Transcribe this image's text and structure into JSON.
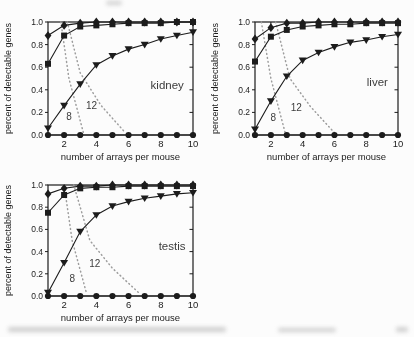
{
  "figure": {
    "background": "#fcfcfc",
    "ink": "#1c1c1c",
    "dotted_color": "#9d9d9d",
    "annotation_color": "#3c3c3c"
  },
  "chart_data": [
    {
      "type": "line",
      "tissue_label": "kidney",
      "tissue_label_pos": [
        8.4,
        0.41
      ],
      "xlabel": "number of arrays per mouse",
      "ylabel": "percent of detectable genes",
      "xlim": [
        1,
        10
      ],
      "ylim": [
        0,
        1
      ],
      "xticks": [
        2,
        4,
        6,
        8,
        10
      ],
      "yticks": [
        0.0,
        0.2,
        0.4,
        0.6,
        0.8,
        1.0
      ],
      "ytick_labels": [
        "0.0",
        "0.2",
        "0.4",
        "0.6",
        "0.8",
        "1.0"
      ],
      "grid": false,
      "legend": "none",
      "x": [
        1,
        2,
        3,
        4,
        5,
        6,
        7,
        8,
        9,
        10
      ],
      "series": [
        {
          "name": "high-start-curve",
          "marker": "diamond",
          "values": [
            0.88,
            0.97,
            0.99,
            1.0,
            1.0,
            1.0,
            1.0,
            1.0,
            1.0,
            1.0
          ]
        },
        {
          "name": "mid-start-curve",
          "marker": "square",
          "values": [
            0.63,
            0.88,
            0.96,
            0.97,
            0.98,
            0.99,
            0.99,
            0.99,
            1.0,
            1.0
          ]
        },
        {
          "name": "low-start-curve",
          "marker": "triangle-down",
          "values": [
            0.06,
            0.26,
            0.45,
            0.62,
            0.7,
            0.76,
            0.8,
            0.85,
            0.88,
            0.91
          ]
        },
        {
          "name": "zero-line",
          "marker": "circle",
          "values": [
            0,
            0,
            0,
            0,
            0,
            0,
            0,
            0,
            0,
            0
          ]
        }
      ],
      "dotted_lines": [
        {
          "label": "8",
          "points": [
            [
              1.8,
              1.0
            ],
            [
              2.3,
              0.5
            ],
            [
              3.2,
              0.02
            ]
          ],
          "label_pos": [
            2.3,
            0.13
          ]
        },
        {
          "label": "12",
          "points": [
            [
              2.2,
              1.0
            ],
            [
              3.0,
              0.55
            ],
            [
              4.3,
              0.26
            ],
            [
              5.8,
              0.02
            ]
          ],
          "label_pos": [
            3.7,
            0.23
          ]
        }
      ]
    },
    {
      "type": "line",
      "tissue_label": "liver",
      "tissue_label_pos": [
        8.7,
        0.43
      ],
      "xlabel": "number of arrays per mouse",
      "ylabel": "percent of detectable genes",
      "xlim": [
        1,
        10
      ],
      "ylim": [
        0,
        1
      ],
      "xticks": [
        2,
        4,
        6,
        8,
        10
      ],
      "yticks": [
        0.0,
        0.2,
        0.4,
        0.6,
        0.8,
        1.0
      ],
      "ytick_labels": [
        "0.0",
        "0.2",
        "0.4",
        "0.6",
        "0.8",
        "1.0"
      ],
      "grid": false,
      "legend": "none",
      "x": [
        1,
        2,
        3,
        4,
        5,
        6,
        7,
        8,
        9,
        10
      ],
      "series": [
        {
          "name": "high-start-curve",
          "marker": "diamond",
          "values": [
            0.85,
            0.95,
            0.99,
            0.99,
            1.0,
            1.0,
            1.0,
            1.0,
            1.0,
            1.0
          ]
        },
        {
          "name": "mid-start-curve",
          "marker": "square",
          "values": [
            0.65,
            0.87,
            0.93,
            0.96,
            0.97,
            0.98,
            0.98,
            0.99,
            0.99,
            0.99
          ]
        },
        {
          "name": "low-start-curve",
          "marker": "triangle-down",
          "values": [
            0.05,
            0.3,
            0.52,
            0.66,
            0.73,
            0.78,
            0.82,
            0.84,
            0.87,
            0.89
          ]
        },
        {
          "name": "zero-line",
          "marker": "circle",
          "values": [
            0,
            0,
            0,
            0,
            0,
            0,
            0,
            0,
            0,
            0
          ]
        }
      ],
      "dotted_lines": [
        {
          "label": "8",
          "points": [
            [
              1.4,
              1.0
            ],
            [
              2.0,
              0.5
            ],
            [
              2.9,
              0.02
            ]
          ],
          "label_pos": [
            2.15,
            0.12
          ]
        },
        {
          "label": "12",
          "points": [
            [
              2.3,
              1.0
            ],
            [
              3.2,
              0.5
            ],
            [
              4.5,
              0.25
            ],
            [
              6.0,
              0.02
            ]
          ],
          "label_pos": [
            3.6,
            0.21
          ]
        }
      ]
    },
    {
      "type": "line",
      "tissue_label": "testis",
      "tissue_label_pos": [
        8.7,
        0.41
      ],
      "xlabel": "number of arrays per mouse",
      "ylabel": "percent of detectable genes",
      "xlim": [
        1,
        10
      ],
      "ylim": [
        0,
        1
      ],
      "xticks": [
        2,
        4,
        6,
        8,
        10
      ],
      "yticks": [
        0.0,
        0.2,
        0.4,
        0.6,
        0.8,
        1.0
      ],
      "ytick_labels": [
        "0.0",
        "0.2",
        "0.4",
        "0.6",
        "0.8",
        "1.0"
      ],
      "grid": false,
      "legend": "none",
      "x": [
        1,
        2,
        3,
        4,
        5,
        6,
        7,
        8,
        9,
        10
      ],
      "series": [
        {
          "name": "high-start-curve",
          "marker": "diamond",
          "values": [
            0.92,
            0.97,
            0.99,
            0.99,
            1.0,
            1.0,
            1.0,
            1.0,
            1.0,
            1.0
          ]
        },
        {
          "name": "mid-start-curve",
          "marker": "square",
          "values": [
            0.75,
            0.91,
            0.97,
            0.98,
            0.98,
            0.99,
            0.99,
            0.99,
            0.99,
            0.99
          ]
        },
        {
          "name": "low-start-curve",
          "marker": "triangle-down",
          "values": [
            0.03,
            0.3,
            0.58,
            0.73,
            0.81,
            0.85,
            0.88,
            0.9,
            0.92,
            0.93
          ]
        },
        {
          "name": "zero-line",
          "marker": "circle",
          "values": [
            0,
            0,
            0,
            0,
            0,
            0,
            0,
            0,
            0,
            0
          ]
        }
      ],
      "dotted_lines": [
        {
          "label": "8",
          "points": [
            [
              2.0,
              1.0
            ],
            [
              2.5,
              0.5
            ],
            [
              3.4,
              0.02
            ]
          ],
          "label_pos": [
            2.5,
            0.13
          ]
        },
        {
          "label": "12",
          "points": [
            [
              2.6,
              1.0
            ],
            [
              3.6,
              0.5
            ],
            [
              5.0,
              0.25
            ],
            [
              6.7,
              0.02
            ]
          ],
          "label_pos": [
            3.9,
            0.26
          ]
        }
      ]
    }
  ]
}
